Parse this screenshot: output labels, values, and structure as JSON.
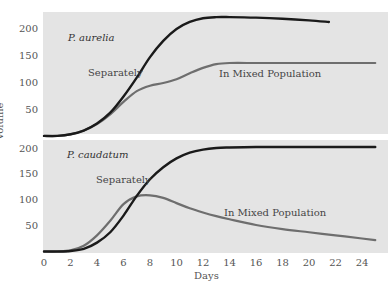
{
  "chart_data": [
    {
      "type": "line",
      "title": "P. aurelia",
      "xlabel": "Days",
      "ylabel": "Volume",
      "xlim": [
        0,
        25
      ],
      "ylim": [
        0,
        220
      ],
      "yticks": [
        50,
        100,
        150,
        200
      ],
      "series": [
        {
          "name": "Separately",
          "color": "#1a1a1a",
          "x": [
            0,
            1,
            2,
            3,
            4,
            5,
            6,
            7,
            8,
            9,
            10,
            11,
            12,
            13,
            14,
            16,
            18,
            20,
            21.5
          ],
          "values": [
            2,
            2,
            5,
            12,
            25,
            45,
            75,
            110,
            148,
            178,
            200,
            213,
            220,
            222,
            222,
            221,
            219,
            216,
            213
          ]
        },
        {
          "name": "In Mixed Population",
          "color": "#6e6e6e",
          "x": [
            0,
            1,
            2,
            3,
            4,
            5,
            6,
            7,
            8,
            9,
            10,
            11,
            12,
            13,
            14,
            16,
            18,
            20,
            22,
            24,
            25
          ],
          "values": [
            2,
            2,
            5,
            12,
            24,
            42,
            65,
            85,
            95,
            100,
            107,
            118,
            128,
            135,
            137,
            137,
            137,
            137,
            137,
            137,
            137
          ]
        }
      ]
    },
    {
      "type": "line",
      "title": "P. caudatum",
      "xlabel": "Days",
      "ylabel": "Volume",
      "xlim": [
        0,
        25
      ],
      "ylim": [
        0,
        210
      ],
      "yticks": [
        50,
        100,
        150,
        200
      ],
      "xticks": [
        0,
        2,
        4,
        6,
        8,
        10,
        12,
        14,
        16,
        18,
        20,
        22,
        24
      ],
      "series": [
        {
          "name": "Separately",
          "color": "#1a1a1a",
          "x": [
            0,
            1,
            2,
            3,
            4,
            5,
            6,
            7,
            8,
            9,
            10,
            11,
            12,
            13,
            14,
            16,
            18,
            20,
            22,
            24,
            25
          ],
          "values": [
            1,
            1,
            2,
            6,
            18,
            38,
            70,
            108,
            140,
            163,
            180,
            191,
            197,
            200,
            201,
            202,
            202,
            202,
            202,
            202,
            202
          ]
        },
        {
          "name": "In Mixed Population",
          "color": "#6e6e6e",
          "x": [
            0,
            1,
            2,
            3,
            4,
            5,
            6,
            7,
            8,
            9,
            10,
            11,
            12,
            13,
            14,
            16,
            18,
            20,
            22,
            24,
            25
          ],
          "values": [
            1,
            1,
            3,
            12,
            32,
            60,
            92,
            107,
            109,
            104,
            94,
            84,
            76,
            69,
            63,
            52,
            44,
            38,
            32,
            26,
            23
          ]
        }
      ]
    }
  ],
  "axes": {
    "xlabel": "Days",
    "ylabel": "Volume",
    "xticks": [
      "0",
      "2",
      "4",
      "6",
      "8",
      "10",
      "12",
      "14",
      "16",
      "18",
      "20",
      "22",
      "24"
    ],
    "yticks_top": [
      "200",
      "150",
      "100",
      "50"
    ],
    "yticks_bottom": [
      "200",
      "150",
      "100",
      "50"
    ]
  },
  "labels": {
    "top_title": "P. aurelia",
    "bottom_title": "P. caudatum",
    "top_separately": "Separately",
    "top_mixed": "In Mixed Population",
    "bottom_separately": "Separately",
    "bottom_mixed": "In Mixed Population"
  }
}
